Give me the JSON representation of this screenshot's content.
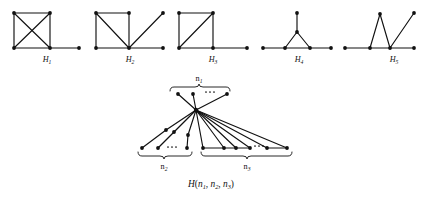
{
  "figure": {
    "title_caption": "H(n1, n2, n3)",
    "background_color": "#ffffff",
    "ink_color": "#111111"
  },
  "small_graphs": [
    {
      "id": "H1",
      "label_base": "H",
      "label_sub": "1",
      "description": "K4 drawn as a square with both diagonals, plus one pendant edge at the bottom-right corner",
      "vertex_count": 5,
      "edge_count": 7,
      "nodes": [
        {
          "name": "top-left",
          "x": 14,
          "y": 13
        },
        {
          "name": "top-right",
          "x": 50,
          "y": 13
        },
        {
          "name": "bottom-left",
          "x": 14,
          "y": 48
        },
        {
          "name": "bottom-right",
          "x": 50,
          "y": 48
        },
        {
          "name": "pendant",
          "x": 79,
          "y": 48
        }
      ],
      "edges": [
        [
          0,
          1
        ],
        [
          0,
          2
        ],
        [
          1,
          3
        ],
        [
          2,
          3
        ],
        [
          0,
          3
        ],
        [
          1,
          2
        ],
        [
          3,
          4
        ]
      ],
      "label_x": 47,
      "label_y": 62
    },
    {
      "id": "H2",
      "label_base": "H",
      "label_sub": "2",
      "description": "Square with one diagonal plus a pendant vertex up-right and a pendant vertex right, both joined to the bottom-right hub",
      "vertex_count": 6,
      "edge_count": 6,
      "nodes": [
        {
          "name": "top-left",
          "x": 96,
          "y": 13
        },
        {
          "name": "top-right",
          "x": 129,
          "y": 13
        },
        {
          "name": "bottom-left",
          "x": 96,
          "y": 48
        },
        {
          "name": "hub",
          "x": 129,
          "y": 48
        },
        {
          "name": "upper-right-pendant",
          "x": 163,
          "y": 13
        },
        {
          "name": "right-pendant",
          "x": 163,
          "y": 48
        }
      ],
      "edges": [
        [
          0,
          1
        ],
        [
          0,
          2
        ],
        [
          1,
          3
        ],
        [
          2,
          3
        ],
        [
          0,
          3
        ],
        [
          3,
          4
        ],
        [
          3,
          5
        ]
      ],
      "label_x": 130,
      "label_y": 62
    },
    {
      "id": "H3",
      "label_base": "H",
      "label_sub": "3",
      "description": "Square with one diagonal plus a pendant edge to the right from the bottom-right corner",
      "vertex_count": 5,
      "edge_count": 6,
      "nodes": [
        {
          "name": "top-left",
          "x": 179,
          "y": 13
        },
        {
          "name": "top-right",
          "x": 213,
          "y": 13
        },
        {
          "name": "bottom-left",
          "x": 179,
          "y": 48
        },
        {
          "name": "bottom-right",
          "x": 213,
          "y": 48
        },
        {
          "name": "pendant",
          "x": 247,
          "y": 48
        }
      ],
      "edges": [
        [
          0,
          1
        ],
        [
          0,
          2
        ],
        [
          1,
          3
        ],
        [
          2,
          3
        ],
        [
          1,
          2
        ],
        [
          3,
          4
        ]
      ],
      "label_x": 213,
      "label_y": 62
    },
    {
      "id": "H4",
      "label_base": "H",
      "label_sub": "4",
      "description": "Triangle with a vertical pendant edge on its apex and a horizontal pendant edge at each base vertex",
      "vertex_count": 6,
      "edge_count": 6,
      "nodes": [
        {
          "name": "apex-pendant",
          "x": 297,
          "y": 13
        },
        {
          "name": "apex",
          "x": 297,
          "y": 32
        },
        {
          "name": "base-left",
          "x": 285,
          "y": 48
        },
        {
          "name": "base-right",
          "x": 310,
          "y": 48
        },
        {
          "name": "left-pendant",
          "x": 263,
          "y": 48
        },
        {
          "name": "right-pendant",
          "x": 331,
          "y": 48
        }
      ],
      "edges": [
        [
          0,
          1
        ],
        [
          1,
          2
        ],
        [
          1,
          3
        ],
        [
          2,
          3
        ],
        [
          2,
          4
        ],
        [
          3,
          5
        ]
      ],
      "label_x": 299,
      "label_y": 62
    },
    {
      "id": "H5",
      "label_base": "H",
      "label_sub": "5",
      "description": "Horizontal path of four vertices with a raised apex forming a triangle and a crossing edge rising to the upper right",
      "vertex_count": 6,
      "edge_count": 6,
      "nodes": [
        {
          "name": "base-far-left",
          "x": 345,
          "y": 48
        },
        {
          "name": "base-left",
          "x": 370,
          "y": 48
        },
        {
          "name": "base-right",
          "x": 390,
          "y": 48
        },
        {
          "name": "base-far-right",
          "x": 414,
          "y": 48
        },
        {
          "name": "apex",
          "x": 380,
          "y": 14
        },
        {
          "name": "upper-right",
          "x": 414,
          "y": 13
        }
      ],
      "edges": [
        [
          0,
          1
        ],
        [
          1,
          2
        ],
        [
          2,
          3
        ],
        [
          1,
          4
        ],
        [
          2,
          4
        ],
        [
          2,
          5
        ]
      ],
      "label_x": 394,
      "label_y": 62
    }
  ],
  "main_graph": {
    "id": "H(n1,n2,n3)",
    "description": "A graph with one central hub vertex joined to n1 pendant vertices above, to n2 paths of length two descending to the lower left, and to n3 vertices forming a horizontal path at the lower right",
    "caption": {
      "base": "H",
      "open_paren": "(",
      "arg1_base": "n",
      "arg1_sub": "1",
      "comma1": ",",
      "arg2_base": "n",
      "arg2_sub": "2",
      "comma2": ",",
      "arg3_base": "n",
      "arg3_sub": "3",
      "close_paren": ")"
    },
    "hub": {
      "name": "center-hub",
      "x": 196,
      "y": 110
    },
    "branches": [
      {
        "name": "branch-n1-top",
        "label_base": "n",
        "label_sub": "1",
        "label_x": 199,
        "label_y": 79,
        "label_position": "above",
        "brace_orientation": "down",
        "brace_left_x": 170,
        "brace_right_x": 230,
        "brace_y": 88,
        "brace_depth": 4,
        "ellipsis_x": 211,
        "ellipsis_y": 93,
        "nodes": [
          {
            "x": 178,
            "y": 94
          },
          {
            "x": 193,
            "y": 94
          },
          {
            "x": 227,
            "y": 94
          }
        ]
      },
      {
        "name": "branch-n2-lower-left",
        "label_base": "n",
        "label_sub": "2",
        "label_x": 164,
        "label_y": 168,
        "label_position": "below",
        "brace_orientation": "up",
        "brace_left_x": 138,
        "brace_right_x": 192,
        "brace_y": 156,
        "brace_depth": 4,
        "ellipsis_x": 172,
        "ellipsis_y": 150,
        "mid_nodes": [
          {
            "x": 166,
            "y": 130
          },
          {
            "x": 174,
            "y": 132
          },
          {
            "x": 188,
            "y": 135
          }
        ],
        "end_nodes": [
          {
            "x": 142,
            "y": 148
          },
          {
            "x": 158,
            "y": 148
          },
          {
            "x": 187,
            "y": 148
          }
        ]
      },
      {
        "name": "branch-n3-lower-right",
        "label_base": "n",
        "label_sub": "3",
        "label_x": 247,
        "label_y": 168,
        "label_position": "below",
        "brace_orientation": "up",
        "brace_left_x": 201,
        "brace_right_x": 292,
        "brace_y": 156,
        "brace_depth": 4,
        "ellipsis_x": 258,
        "ellipsis_y": 146,
        "nodes": [
          {
            "x": 203,
            "y": 148
          },
          {
            "x": 224,
            "y": 148
          },
          {
            "x": 236,
            "y": 148
          },
          {
            "x": 250,
            "y": 148
          },
          {
            "x": 267,
            "y": 148
          },
          {
            "x": 287,
            "y": 148
          }
        ],
        "path_segments": [
          [
            0,
            1
          ],
          [
            1,
            2
          ],
          [
            2,
            3
          ],
          [
            4,
            5
          ]
        ]
      }
    ]
  }
}
